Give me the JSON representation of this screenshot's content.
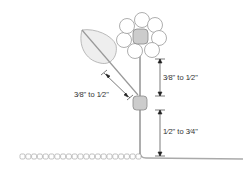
{
  "diagram": {
    "labels": {
      "leaf_stem_length": "3⁄8\" to 1⁄2\"",
      "flower_to_node": "3⁄8\" to 1⁄2\"",
      "node_to_base": "1⁄2\" to 3⁄4\""
    },
    "colors": {
      "outline": "#888888",
      "petal_fill": "#ffffff",
      "center_fill": "#cccccc",
      "leaf_fill": "#eeeeee",
      "stem": "#999999",
      "dimension": "#222222"
    },
    "chain_count": 21
  }
}
